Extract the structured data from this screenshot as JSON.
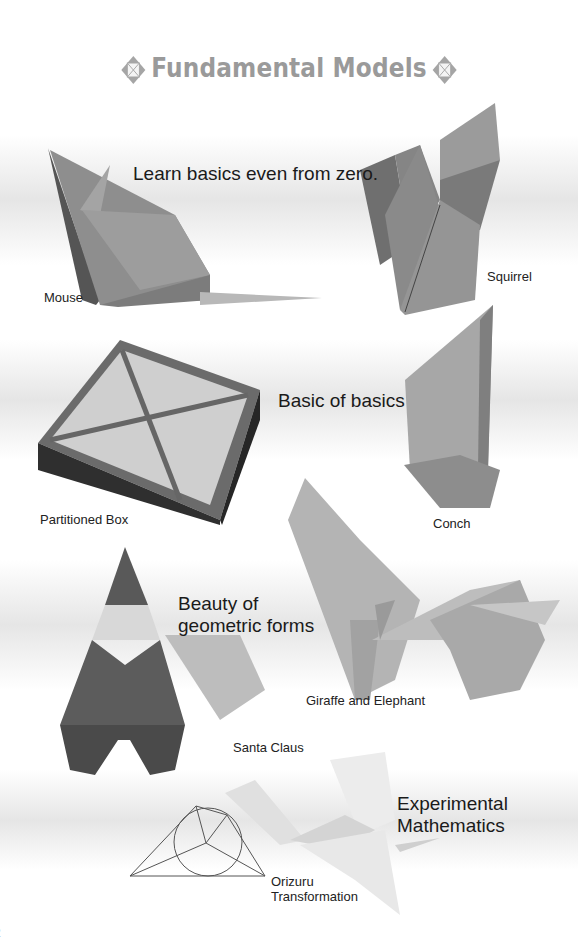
{
  "page": {
    "title": "Fundamental Models",
    "title_ornament_icon": "diamond-cross-icon",
    "colors": {
      "title_gray": "#9a9a9a",
      "text": "#222222",
      "band": "#e1e1e1"
    }
  },
  "sections": [
    {
      "tagline": "Learn basics even from zero.",
      "models": [
        {
          "name": "Mouse"
        },
        {
          "name": "Squirrel"
        }
      ]
    },
    {
      "tagline": "Basic of basics",
      "models": [
        {
          "name": "Partitioned Box"
        },
        {
          "name": "Conch"
        }
      ]
    },
    {
      "tagline": "Beauty of geometric forms",
      "models": [
        {
          "name": "Giraffe and Elephant"
        },
        {
          "name": "Santa Claus"
        }
      ]
    },
    {
      "tagline": "Experimental Mathematics",
      "models": [
        {
          "name": "Orizuru Transformation"
        }
      ]
    }
  ],
  "footer": {
    "page_number": "2"
  }
}
